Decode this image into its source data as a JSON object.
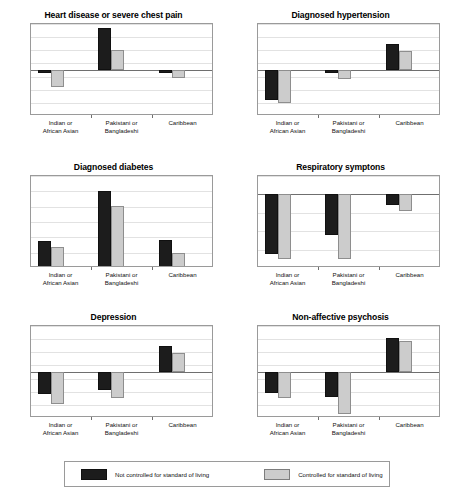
{
  "figure": {
    "categories": [
      "Indian or African Asian",
      "Pakistani or Bangladeshi",
      "Caribbean"
    ],
    "category_lines": [
      [
        "Indian or",
        "African Asian"
      ],
      [
        "Pakistani or",
        "Bangladeshi"
      ],
      [
        "Caribbean",
        ""
      ]
    ],
    "legend": {
      "dark_label": "Not controlled for standard of living",
      "light_label": "Controlled for standard of living",
      "dark_color": "#1c1c1c",
      "light_color": "#cccccc"
    }
  },
  "chart_data": [
    {
      "type": "bar",
      "title": "Heart disease or severe chest pain",
      "xlabel": "",
      "ylabel": "",
      "categories": [
        "Indian or African Asian",
        "Pakistani or Bangladeshi",
        "Caribbean"
      ],
      "series": [
        {
          "name": "Not controlled for standard of living",
          "values": [
            -0.05,
            0.64,
            -0.04
          ]
        },
        {
          "name": "Controlled for standard of living",
          "values": [
            -0.26,
            0.31,
            -0.12
          ]
        }
      ],
      "ylim": [
        -0.7,
        0.7
      ],
      "yticks": [
        -0.7,
        -0.5,
        -0.3,
        -0.1,
        0.1,
        0.3,
        0.5,
        0.7
      ],
      "ytick_labels": [
        "-0.7",
        "-0.5",
        "-0.3",
        "-0.1",
        "0.1",
        "0.3",
        "0.5",
        "0.7"
      ],
      "zero_line": 0,
      "grid": true,
      "legend_position": "bottom"
    },
    {
      "type": "bar",
      "title": "Diagnosed hypertension",
      "xlabel": "",
      "ylabel": "",
      "categories": [
        "Indian or African Asian",
        "Pakistani or Bangladeshi",
        "Caribbean"
      ],
      "series": [
        {
          "name": "Not controlled for standard of living",
          "values": [
            -0.45,
            -0.05,
            0.4
          ]
        },
        {
          "name": "Controlled for standard of living",
          "values": [
            -0.5,
            -0.13,
            0.29
          ]
        }
      ],
      "ylim": [
        -0.7,
        0.7
      ],
      "yticks": [
        -0.7,
        -0.5,
        -0.3,
        -0.1,
        0.1,
        0.3,
        0.5,
        0.7
      ],
      "ytick_labels": [
        "-0.7",
        "-0.5",
        "-0.3",
        "-0.1",
        "0.1",
        "0.3",
        "0.5",
        "0.7"
      ],
      "zero_line": 0,
      "grid": true,
      "legend_position": "bottom"
    },
    {
      "type": "bar",
      "title": "Diagnosed diabetes",
      "xlabel": "",
      "ylabel": "",
      "categories": [
        "Indian or African Asian",
        "Pakistani or Bangladeshi",
        "Caribbean"
      ],
      "series": [
        {
          "name": "Not controlled for standard of living",
          "values": [
            0.95,
            1.6,
            0.96
          ]
        },
        {
          "name": "Controlled for standard of living",
          "values": [
            0.87,
            1.41,
            0.79
          ]
        }
      ],
      "ylim": [
        0.6,
        1.8
      ],
      "yticks": [
        0.6,
        0.8,
        1.0,
        1.2,
        1.4,
        1.6,
        1.8
      ],
      "ytick_labels": [
        "0.6",
        "0.8",
        "1.0",
        "1.2",
        "1.4",
        "1.6",
        "1.8"
      ],
      "zero_line": 0.6,
      "grid": true,
      "legend_position": "bottom"
    },
    {
      "type": "bar",
      "title": "Respiratory symptons",
      "xlabel": "",
      "ylabel": "",
      "categories": [
        "Indian or African Asian",
        "Pakistani or Bangladeshi",
        "Caribbean"
      ],
      "series": [
        {
          "name": "Not controlled for standard of living",
          "values": [
            -0.65,
            -0.44,
            -0.11
          ]
        },
        {
          "name": "Controlled for standard of living",
          "values": [
            -0.7,
            -0.7,
            -0.18
          ]
        }
      ],
      "ylim": [
        -0.8,
        0.2
      ],
      "yticks": [
        -0.8,
        -0.6,
        -0.4,
        -0.2,
        0.0,
        0.2
      ],
      "ytick_labels": [
        "-0.8",
        "-0.6",
        "-0.4",
        "-0.2",
        "0.0",
        "0.2"
      ],
      "zero_line": 0,
      "grid": true,
      "legend_position": "bottom"
    },
    {
      "type": "bar",
      "title": "Depression",
      "xlabel": "",
      "ylabel": "",
      "categories": [
        "Indian or African Asian",
        "Pakistani or Bangladeshi",
        "Caribbean"
      ],
      "series": [
        {
          "name": "Not controlled for standard of living",
          "values": [
            -0.34,
            -0.27,
            0.39
          ]
        },
        {
          "name": "Controlled for standard of living",
          "values": [
            -0.48,
            -0.4,
            0.29
          ]
        }
      ],
      "ylim": [
        -0.7,
        0.7
      ],
      "yticks": [
        -0.7,
        -0.5,
        -0.3,
        -0.1,
        0.1,
        0.3,
        0.5,
        0.7
      ],
      "ytick_labels": [
        "-0.7",
        "-0.5",
        "-0.3",
        "-0.1",
        "0.1",
        "0.3",
        "0.5",
        "0.7"
      ],
      "zero_line": 0,
      "grid": true,
      "legend_position": "bottom"
    },
    {
      "type": "bar",
      "title": "Non-affective psychosis",
      "xlabel": "",
      "ylabel": "",
      "categories": [
        "Indian or African Asian",
        "Pakistani or Bangladeshi",
        "Caribbean"
      ],
      "series": [
        {
          "name": "Not controlled for standard of living",
          "values": [
            -0.32,
            -0.38,
            0.51
          ]
        },
        {
          "name": "Controlled for standard of living",
          "values": [
            -0.4,
            -0.64,
            0.47
          ]
        }
      ],
      "ylim": [
        -0.7,
        0.7
      ],
      "yticks": [
        -0.7,
        -0.5,
        -0.3,
        -0.1,
        0.1,
        0.3,
        0.5,
        0.7
      ],
      "ytick_labels": [
        "-0.7",
        "-0.5",
        "-0.3",
        "-0.1",
        "0.1",
        "0.3",
        "0.5",
        "0.7"
      ],
      "zero_line": 0,
      "grid": true,
      "legend_position": "bottom"
    }
  ]
}
